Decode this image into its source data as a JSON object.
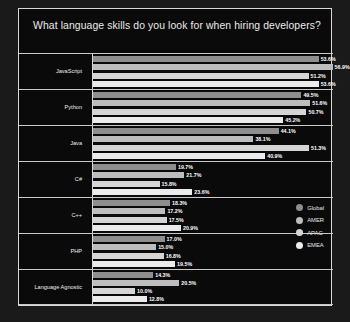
{
  "chart_data": {
    "type": "bar",
    "title": "What language skills do you look for when hiring developers?",
    "xlabel": "",
    "ylabel": "",
    "orientation": "horizontal",
    "grid": false,
    "legend_position": "right",
    "xlim": [
      0,
      57
    ],
    "categories": [
      "JavaScript",
      "Python",
      "Java",
      "C#",
      "C++",
      "PHP",
      "Language Agnostic"
    ],
    "series": [
      {
        "name": "Global",
        "color": "#8e8e8e",
        "values": [
          53.6,
          49.5,
          44.1,
          19.7,
          18.3,
          17.0,
          14.3
        ],
        "labels": [
          "53.6%",
          "49.5%",
          "44.1%",
          "19.7%",
          "18.3%",
          "17.0%",
          "14.3%"
        ]
      },
      {
        "name": "AMER",
        "color": "#bdbdbd",
        "values": [
          56.9,
          51.6,
          38.1,
          21.7,
          17.2,
          15.0,
          20.5
        ],
        "labels": [
          "56.9%",
          "51.6%",
          "38.1%",
          "21.7%",
          "17.2%",
          "15.0%",
          "20.5%"
        ]
      },
      {
        "name": "APAC",
        "color": "#d5d5d5",
        "values": [
          51.2,
          50.7,
          51.3,
          15.8,
          17.5,
          16.8,
          10.0
        ],
        "labels": [
          "51.2%",
          "50.7%",
          "51.3%",
          "15.8%",
          "17.5%",
          "16.8%",
          "10.0%"
        ]
      },
      {
        "name": "EMEA",
        "color": "#ebebeb",
        "values": [
          53.6,
          45.2,
          40.9,
          23.6,
          20.9,
          19.5,
          12.8
        ],
        "labels": [
          "53.6%",
          "45.2%",
          "40.9%",
          "23.6%",
          "20.9%",
          "19.5%",
          "12.8%"
        ]
      }
    ]
  },
  "legend": {
    "items": [
      {
        "label": "Global",
        "color": "#8e8e8e"
      },
      {
        "label": "AMER",
        "color": "#bdbdbd"
      },
      {
        "label": "APAC",
        "color": "#d5d5d5"
      },
      {
        "label": "EMEA",
        "color": "#ebebeb"
      }
    ]
  }
}
